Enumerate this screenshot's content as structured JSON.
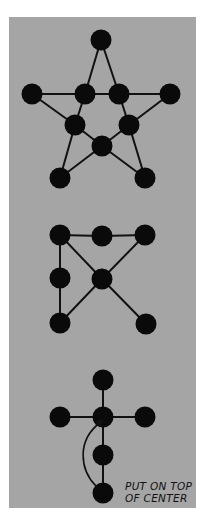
{
  "diagram": {
    "background_color": "#a5a5a5",
    "node_color": "#0a0a0a",
    "figures": [
      {
        "name": "star-puzzle",
        "nodes": [
          {
            "id": "top",
            "x": 101,
            "y": 40
          },
          {
            "id": "outer-left",
            "x": 32,
            "y": 94
          },
          {
            "id": "inner-left",
            "x": 85,
            "y": 94
          },
          {
            "id": "inner-right",
            "x": 119,
            "y": 94
          },
          {
            "id": "outer-right",
            "x": 170,
            "y": 94
          },
          {
            "id": "mid-left",
            "x": 75,
            "y": 125
          },
          {
            "id": "mid-right",
            "x": 129,
            "y": 125
          },
          {
            "id": "center",
            "x": 102,
            "y": 146
          },
          {
            "id": "bottom-left",
            "x": 60,
            "y": 178
          },
          {
            "id": "bottom-right",
            "x": 145,
            "y": 178
          }
        ],
        "edges": [
          [
            "top",
            "inner-left"
          ],
          [
            "top",
            "inner-right"
          ],
          [
            "outer-left",
            "inner-left"
          ],
          [
            "inner-left",
            "inner-right"
          ],
          [
            "inner-right",
            "outer-right"
          ],
          [
            "outer-left",
            "mid-left"
          ],
          [
            "inner-left",
            "mid-left"
          ],
          [
            "inner-right",
            "mid-right"
          ],
          [
            "outer-right",
            "mid-right"
          ],
          [
            "mid-left",
            "center"
          ],
          [
            "mid-right",
            "center"
          ],
          [
            "mid-left",
            "bottom-left"
          ],
          [
            "bottom-left",
            "center"
          ],
          [
            "mid-right",
            "bottom-right"
          ],
          [
            "center",
            "bottom-right"
          ]
        ]
      },
      {
        "name": "square-puzzle",
        "nodes": [
          {
            "id": "top-left",
            "x": 60,
            "y": 235
          },
          {
            "id": "top-mid",
            "x": 102,
            "y": 236
          },
          {
            "id": "top-right",
            "x": 145,
            "y": 235
          },
          {
            "id": "mid-left",
            "x": 60,
            "y": 278
          },
          {
            "id": "center",
            "x": 102,
            "y": 279
          },
          {
            "id": "bottom-left",
            "x": 60,
            "y": 323
          },
          {
            "id": "bottom-right",
            "x": 146,
            "y": 324
          }
        ],
        "edges": [
          [
            "top-left",
            "top-mid"
          ],
          [
            "top-mid",
            "top-right"
          ],
          [
            "top-left",
            "mid-left"
          ],
          [
            "mid-left",
            "bottom-left"
          ],
          [
            "top-left",
            "center"
          ],
          [
            "top-right",
            "center"
          ],
          [
            "center",
            "bottom-left"
          ],
          [
            "center",
            "bottom-right"
          ]
        ]
      },
      {
        "name": "cross-puzzle",
        "nodes": [
          {
            "id": "top",
            "x": 103,
            "y": 380
          },
          {
            "id": "left",
            "x": 60,
            "y": 417
          },
          {
            "id": "center",
            "x": 103,
            "y": 417
          },
          {
            "id": "right",
            "x": 145,
            "y": 417
          },
          {
            "id": "lower",
            "x": 103,
            "y": 455
          },
          {
            "id": "bottom",
            "x": 103,
            "y": 493
          }
        ],
        "edges": [
          [
            "top",
            "center"
          ],
          [
            "left",
            "center"
          ],
          [
            "center",
            "right"
          ],
          [
            "center",
            "lower"
          ],
          [
            "lower",
            "bottom"
          ]
        ],
        "annotation": {
          "line1": "PUT ON TOP",
          "line2": "OF CENTER",
          "arrow_from": "bottom",
          "arrow_to": "center"
        }
      }
    ]
  }
}
